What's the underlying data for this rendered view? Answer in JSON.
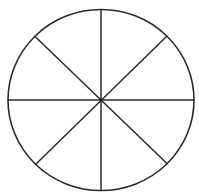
{
  "diagram": {
    "type": "divided-circle",
    "sector_count": 8,
    "stroke_color": "#2a2a2a",
    "background_color": "#ffffff",
    "circle": {
      "cx": 101,
      "cy": 100,
      "rx": 93,
      "ry": 90.5
    },
    "diameters": [
      {
        "name": "vertical",
        "x1": 101,
        "y1": 9.5,
        "x2": 101,
        "y2": 190.5
      },
      {
        "name": "horizontal",
        "x1": 8,
        "y1": 100,
        "x2": 194,
        "y2": 100
      },
      {
        "name": "diagonal-down",
        "x1": 34.5,
        "y1": 36,
        "x2": 167.5,
        "y2": 164
      },
      {
        "name": "diagonal-up",
        "x1": 167,
        "y1": 36,
        "x2": 35.5,
        "y2": 164.5
      }
    ],
    "center_dot": {
      "cx": 101,
      "cy": 100,
      "r": 1.6
    }
  },
  "header": {
    "clipped_text": ""
  }
}
